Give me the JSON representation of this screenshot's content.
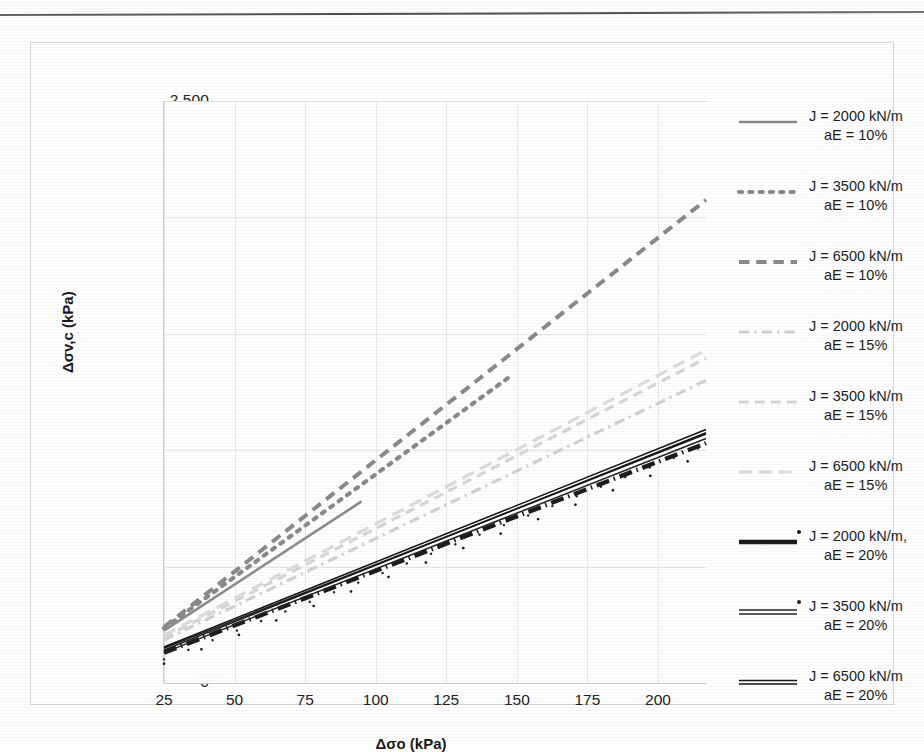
{
  "chart_data": {
    "type": "line",
    "title": "",
    "xlabel": "Δσo (kPa)",
    "ylabel": "Δσv,c (kPa)",
    "xlim": [
      25,
      217
    ],
    "ylim": [
      0,
      2500
    ],
    "xticks": [
      25,
      50,
      75,
      100,
      125,
      150,
      175,
      200
    ],
    "xtick_labels": [
      "25",
      "50",
      "75",
      "100",
      "125",
      "150",
      "175",
      "200"
    ],
    "yticks": [
      0,
      500,
      1000,
      1500,
      2000,
      2500
    ],
    "ytick_labels": [
      "0",
      "500",
      "1,000",
      "1,500",
      "2,000",
      "2,500"
    ],
    "grid": true,
    "legend_position": "right",
    "series": [
      {
        "name": "J = 2000 kN/m aE = 10%",
        "label_line1": "J = 2000 kN/m",
        "label_line2": "aE = 10%",
        "style": "solid",
        "color": "#8c8c8c",
        "width": 2.6,
        "x": [
          25,
          95
        ],
        "y": [
          225,
          780
        ]
      },
      {
        "name": "J = 3500 kN/m aE = 10%",
        "label_line1": "J = 3500 kN/m",
        "label_line2": "aE = 10%",
        "style": "dotted",
        "color": "#8a8a8a",
        "width": 4.2,
        "x": [
          25,
          148
        ],
        "y": [
          235,
          1320
        ]
      },
      {
        "name": "J = 6500 kN/m aE = 10%",
        "label_line1": "J = 6500 kN/m",
        "label_line2": "aE = 10%",
        "style": "dashed",
        "color": "#8a8a8a",
        "width": 4.0,
        "x": [
          25,
          217
        ],
        "y": [
          240,
          2075
        ]
      },
      {
        "name": "J = 2000 kN/m aE = 15%",
        "label_line1": "J = 2000 kN/m",
        "label_line2": "aE = 15%",
        "style": "dashdot-faint",
        "color": "#d2d2d2",
        "width": 3.2,
        "x": [
          25,
          217
        ],
        "y": [
          185,
          1300
        ]
      },
      {
        "name": "J = 3500 kN/m aE = 15%",
        "label_line1": "J = 3500 kN/m",
        "label_line2": "aE = 15%",
        "style": "dashed-faint",
        "color": "#d6d6d6",
        "width": 3.2,
        "x": [
          25,
          217
        ],
        "y": [
          195,
          1395
        ]
      },
      {
        "name": "J = 6500 kN/m aE = 15%",
        "label_line1": "J = 6500 kN/m",
        "label_line2": "aE = 15%",
        "style": "longdash-faint",
        "color": "#dcdcdc",
        "width": 3.2,
        "x": [
          25,
          217
        ],
        "y": [
          205,
          1430
        ]
      },
      {
        "name": "J = 2000 kN/m, aE = 20%",
        "label_line1": "J = 2000 kN/m,",
        "label_line2": "aE = 20%",
        "style": "thick-dashdot",
        "color": "#1c1c1c",
        "width": 4.4,
        "x": [
          25,
          217
        ],
        "y": [
          130,
          1030
        ]
      },
      {
        "name": "J = 3500 kN/m aE = 20%",
        "label_line1": "J = 3500 kN/m",
        "label_line2": "aE = 20%",
        "style": "double-dashdot",
        "color": "#232323",
        "width": 3.0,
        "x": [
          25,
          217
        ],
        "y": [
          140,
          1060
        ]
      },
      {
        "name": "J = 6500 kN/m aE = 20%",
        "label_line1": "J = 6500 kN/m",
        "label_line2": "aE = 20%",
        "style": "thick-solid",
        "color": "#141414",
        "width": 3.4,
        "x": [
          25,
          217
        ],
        "y": [
          148,
          1082
        ]
      }
    ]
  },
  "axes": {
    "y_label": "Δσv,c (kPa)",
    "x_label": "Δσo (kPa)"
  }
}
